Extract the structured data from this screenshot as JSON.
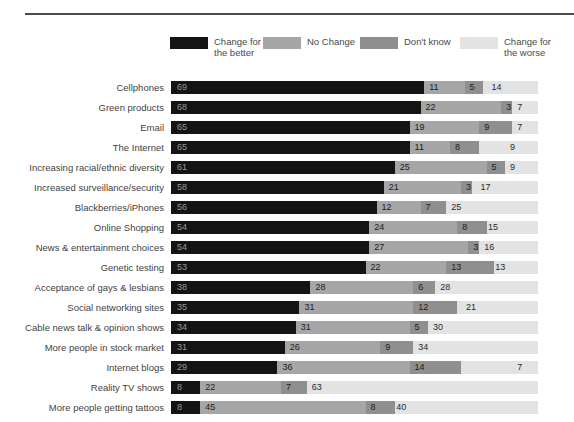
{
  "legend": {
    "items": [
      {
        "label": "Change for the better",
        "lines": [
          "Change for",
          "the better"
        ],
        "color": "#141414"
      },
      {
        "label": "No Change",
        "lines": [
          "No Change"
        ],
        "color": "#a6a6a6"
      },
      {
        "label": "Don't know",
        "lines": [
          "Don't know"
        ],
        "color": "#8f8f8f"
      },
      {
        "label": "Change for the worse",
        "lines": [
          "Change for",
          "the worse"
        ],
        "color": "#e3e3e3"
      }
    ]
  },
  "chart_data": {
    "type": "bar",
    "orientation": "horizontal",
    "stacked": true,
    "unit": "percent",
    "xlim": [
      0,
      100
    ],
    "grid": false,
    "legend_position": "top",
    "categories": [
      "Cellphones",
      "Green products",
      "Email",
      "The Internet",
      "Increasing racial/ethnic diversity",
      "Increased surveillance/security",
      "Blackberries/iPhones",
      "Online Shopping",
      "News & entertainment choices",
      "Genetic testing",
      "Acceptance of gays & lesbians",
      "Social networking sites",
      "Cable news talk & opinion shows",
      "More people in stock market",
      "Internet blogs",
      "Reality TV shows",
      "More people getting tattoos"
    ],
    "series": [
      {
        "name": "Change for the better",
        "color": "#141414",
        "values": [
          69,
          68,
          65,
          65,
          61,
          58,
          56,
          54,
          54,
          53,
          38,
          35,
          34,
          31,
          29,
          8,
          8
        ]
      },
      {
        "name": "No Change",
        "color": "#a6a6a6",
        "values": [
          11,
          22,
          19,
          11,
          25,
          21,
          12,
          24,
          27,
          22,
          28,
          31,
          31,
          26,
          36,
          22,
          45
        ]
      },
      {
        "name": "Don't know",
        "color": "#8f8f8f",
        "values": [
          5,
          3,
          9,
          8,
          5,
          3,
          7,
          8,
          3,
          13,
          6,
          12,
          5,
          9,
          14,
          7,
          8
        ]
      },
      {
        "name": "Change for the worse",
        "color": "#e3e3e3",
        "values": [
          14,
          7,
          7,
          9,
          9,
          17,
          25,
          15,
          16,
          13,
          28,
          21,
          30,
          34,
          7,
          63,
          40
        ]
      }
    ]
  }
}
